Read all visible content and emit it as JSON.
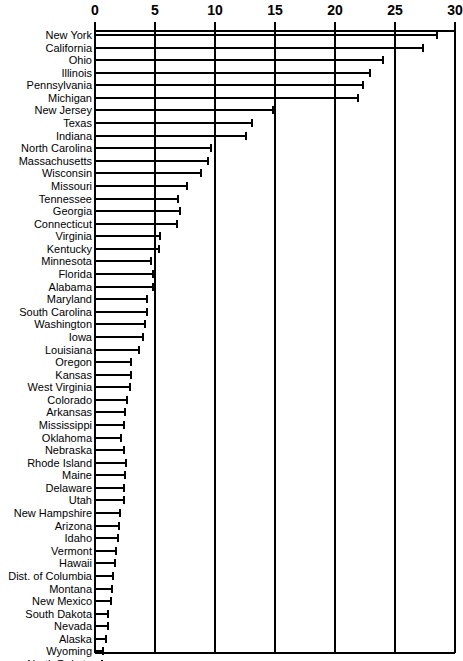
{
  "chart_data": {
    "type": "bar",
    "orientation": "horizontal",
    "title": "",
    "subtitle": "",
    "xlabel": "",
    "ylabel": "",
    "xlim": [
      0,
      30
    ],
    "ylim": null,
    "grid": true,
    "legend": null,
    "axis_position": "top",
    "tick_labels": [
      "0",
      "5",
      "10",
      "15",
      "20",
      "25",
      "30"
    ],
    "ticks": [
      0,
      5,
      10,
      15,
      20,
      25,
      30
    ],
    "categories": [
      "New York",
      "California",
      "Ohio",
      "Illinois",
      "Pennsylvania",
      "Michigan",
      "New Jersey",
      "Texas",
      "Indiana",
      "North Carolina",
      "Massachusetts",
      "Wisconsin",
      "Missouri",
      "Tennessee",
      "Georgia",
      "Connecticut",
      "Virginia",
      "Kentucky",
      "Minnesota",
      "Florida",
      "Alabama",
      "Maryland",
      "South Carolina",
      "Washington",
      "Iowa",
      "Louisiana",
      "Oregon",
      "Kansas",
      "West Virginia",
      "Colorado",
      "Arkansas",
      "Mississippi",
      "Oklahoma",
      "Nebraska",
      "Rhode Island",
      "Maine",
      "Delaware",
      "Utah",
      "New Hampshire",
      "Arizona",
      "Idaho",
      "Vermont",
      "Hawaii",
      "Dist. of Columbia",
      "Montana",
      "New Mexico",
      "South Dakota",
      "Nevada",
      "Alaska",
      "Wyoming",
      "North Dakota"
    ],
    "values": [
      28.5,
      27.3,
      24.0,
      22.9,
      22.3,
      21.9,
      14.8,
      13.1,
      12.6,
      9.7,
      9.4,
      8.8,
      7.7,
      6.9,
      7.1,
      6.8,
      5.4,
      5.3,
      4.7,
      4.8,
      4.8,
      4.3,
      4.3,
      4.2,
      4.0,
      3.7,
      3.0,
      3.0,
      2.9,
      2.7,
      2.5,
      2.4,
      2.2,
      2.4,
      2.6,
      2.5,
      2.4,
      2.4,
      2.1,
      2.0,
      1.9,
      1.75,
      1.7,
      1.5,
      1.4,
      1.35,
      1.1,
      1.05,
      0.9,
      0.7,
      0.6
    ],
    "colors": {
      "bar": "#000000",
      "grid": "#000000",
      "axis": "#000000",
      "background": "#ffffff"
    }
  }
}
